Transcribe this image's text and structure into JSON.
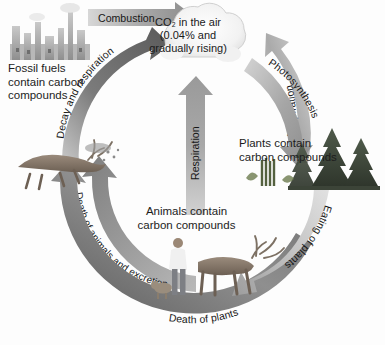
{
  "diagram": {
    "background_color": "#fdfdfd",
    "nodes": {
      "atmosphere": {
        "label": "CO₂ in the air\n(0.04% and\ngradually rising)",
        "icon": "cloud-icon"
      },
      "fossil_fuels": {
        "label": "Fossil fuels\ncontain carbon\ncompounds",
        "icon": "factory-icon"
      },
      "plants": {
        "label": "Plants contain\ncarbon compounds",
        "icon": "conifer-trees-icon"
      },
      "animals": {
        "label": "Animals contain\ncarbon compounds",
        "icon": "person-dog-deer-icon"
      },
      "dead_matter": {
        "icon": "dead-deer-icon"
      }
    },
    "flows": {
      "combustion": {
        "label": "Combustion",
        "color": "#8e8e8e",
        "direction": "right"
      },
      "decay_and_respiration": {
        "label": "Decay and respiration",
        "color": "#6f6f6f",
        "direction": "up-right"
      },
      "respiration_center": {
        "label": "Respiration",
        "color": "#9d9d9d",
        "direction": "up"
      },
      "respiration_right": {
        "label": "Respiration",
        "color": "#a9a9a9",
        "direction": "up-left"
      },
      "photosynthesis": {
        "label": "Photosynthesis",
        "color": "#9a9a9a",
        "direction": "down-right"
      },
      "eating_of_plants": {
        "label": "Eating of plants",
        "color": "#b4b4b4",
        "direction": "down-left"
      },
      "death_of_plants": {
        "label": "Death of plants",
        "color": "#8c8c8c",
        "direction": "left-up"
      },
      "death_of_animals": {
        "label": "Death of animals and excretion",
        "color": "#a2a2a2",
        "direction": "up-left"
      }
    }
  }
}
